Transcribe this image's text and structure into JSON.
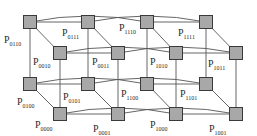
{
  "diagram": {
    "type": "4D hypercube interconnection network",
    "colors": {
      "node_fill": "#a8a8a8",
      "node_border": "#3a3a3a",
      "edge": "#555555",
      "label": "#2a2a2a"
    },
    "nodes": [
      {
        "id": "0110",
        "prefix": "P",
        "sub": "0110",
        "x": 23,
        "y": 15,
        "lx": 4,
        "ly": 35
      },
      {
        "id": "0111",
        "prefix": "P",
        "sub": "0111",
        "x": 81,
        "y": 15,
        "lx": 62,
        "ly": 28
      },
      {
        "id": "1110",
        "prefix": "P",
        "sub": "1110",
        "x": 140,
        "y": 15,
        "lx": 119,
        "ly": 23
      },
      {
        "id": "1111",
        "prefix": "P",
        "sub": "1111",
        "x": 199,
        "y": 15,
        "lx": 178,
        "ly": 28
      },
      {
        "id": "0010",
        "prefix": "P",
        "sub": "0010",
        "x": 53,
        "y": 46,
        "lx": 33,
        "ly": 57
      },
      {
        "id": "0011",
        "prefix": "P",
        "sub": "0011",
        "x": 111,
        "y": 46,
        "lx": 92,
        "ly": 57
      },
      {
        "id": "1010",
        "prefix": "P",
        "sub": "1010",
        "x": 169,
        "y": 46,
        "lx": 150,
        "ly": 57
      },
      {
        "id": "1011",
        "prefix": "P",
        "sub": "1011",
        "x": 229,
        "y": 46,
        "lx": 208,
        "ly": 59
      },
      {
        "id": "0100",
        "prefix": "P",
        "sub": "0100",
        "x": 23,
        "y": 77,
        "lx": 17,
        "ly": 97
      },
      {
        "id": "0101",
        "prefix": "P",
        "sub": "0101",
        "x": 81,
        "y": 77,
        "lx": 63,
        "ly": 92
      },
      {
        "id": "1100",
        "prefix": "P",
        "sub": "1100",
        "x": 140,
        "y": 77,
        "lx": 121,
        "ly": 89
      },
      {
        "id": "1101",
        "prefix": "P",
        "sub": "1101",
        "x": 199,
        "y": 77,
        "lx": 180,
        "ly": 89
      },
      {
        "id": "0000",
        "prefix": "P",
        "sub": "0000",
        "x": 53,
        "y": 107,
        "lx": 35,
        "ly": 120
      },
      {
        "id": "0001",
        "prefix": "P",
        "sub": "0001",
        "x": 111,
        "y": 107,
        "lx": 93,
        "ly": 124
      },
      {
        "id": "1000",
        "prefix": "P",
        "sub": "1000",
        "x": 169,
        "y": 107,
        "lx": 150,
        "ly": 120
      },
      {
        "id": "1001",
        "prefix": "P",
        "sub": "1001",
        "x": 229,
        "y": 107,
        "lx": 209,
        "ly": 124
      }
    ],
    "edges": [
      [
        "0110",
        "0111"
      ],
      [
        "1110",
        "1111"
      ],
      [
        "0010",
        "0011"
      ],
      [
        "1010",
        "1011"
      ],
      [
        "0100",
        "0101"
      ],
      [
        "1100",
        "1101"
      ],
      [
        "0000",
        "0001"
      ],
      [
        "1000",
        "1001"
      ],
      [
        "0110",
        "0010"
      ],
      [
        "0111",
        "0011"
      ],
      [
        "1110",
        "1010"
      ],
      [
        "1111",
        "1011"
      ],
      [
        "0100",
        "0000"
      ],
      [
        "0101",
        "0001"
      ],
      [
        "1100",
        "1000"
      ],
      [
        "1101",
        "1001"
      ],
      [
        "0110",
        "0100"
      ],
      [
        "0111",
        "0101"
      ],
      [
        "1110",
        "1100"
      ],
      [
        "1111",
        "1101"
      ],
      [
        "0010",
        "0000"
      ],
      [
        "0011",
        "0001"
      ],
      [
        "1010",
        "1000"
      ],
      [
        "1011",
        "1001"
      ],
      [
        "0110",
        "1110"
      ],
      [
        "0111",
        "1111"
      ],
      [
        "0010",
        "1010"
      ],
      [
        "0011",
        "1011"
      ],
      [
        "0100",
        "1100"
      ],
      [
        "0101",
        "1101"
      ],
      [
        "0000",
        "1000"
      ],
      [
        "0001",
        "1001"
      ]
    ]
  }
}
